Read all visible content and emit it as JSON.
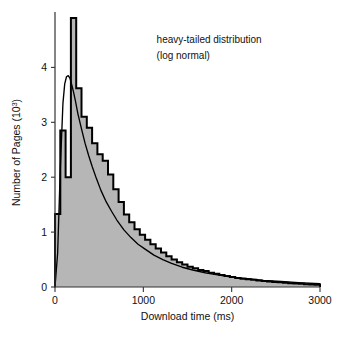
{
  "chart_data": {
    "type": "bar",
    "title": "",
    "xlabel": "Download time (ms)",
    "ylabel": "Number of Pages (10",
    "ylabel_exponent": "3",
    "ylabel_suffix": ")",
    "xlim": [
      0,
      3000
    ],
    "ylim": [
      0,
      4.9
    ],
    "xticks": [
      0,
      1000,
      2000,
      3000
    ],
    "xtick_labels": [
      "0",
      "1000",
      "2000",
      "3000"
    ],
    "yticks": [
      0,
      1,
      2,
      3,
      4
    ],
    "ytick_labels": [
      "0",
      "1",
      "2",
      "3",
      "4"
    ],
    "grid": false,
    "legend": null,
    "annotations": [
      {
        "text": "heavy-tailed distribution",
        "x": 1150,
        "y": 4.45
      },
      {
        "text": "(log normal)",
        "x": 1150,
        "y": 4.15
      }
    ],
    "bin_width": 60,
    "series": [
      {
        "name": "Download time histogram",
        "kind": "histogram",
        "fill_color": "#b6b6b6",
        "line_color": "#000000",
        "bin_left_edges": [
          0,
          60,
          120,
          180,
          240,
          300,
          360,
          420,
          480,
          540,
          600,
          660,
          720,
          780,
          840,
          900,
          960,
          1020,
          1080,
          1140,
          1200,
          1260,
          1320,
          1380,
          1440,
          1500,
          1560,
          1620,
          1680,
          1740,
          1800,
          1860,
          1920,
          1980,
          2040,
          2100,
          2160,
          2220,
          2280,
          2340,
          2400,
          2460,
          2520,
          2580,
          2640,
          2700,
          2760,
          2820,
          2880,
          2940
        ],
        "values": [
          1.33,
          2.85,
          2.0,
          4.95,
          3.62,
          3.1,
          2.9,
          2.62,
          2.42,
          2.3,
          2.05,
          1.78,
          1.55,
          1.32,
          1.18,
          1.05,
          0.95,
          0.86,
          0.78,
          0.7,
          0.63,
          0.56,
          0.5,
          0.45,
          0.41,
          0.37,
          0.34,
          0.31,
          0.29,
          0.26,
          0.24,
          0.22,
          0.2,
          0.18,
          0.165,
          0.15,
          0.14,
          0.13,
          0.12,
          0.11,
          0.1,
          0.092,
          0.085,
          0.078,
          0.07,
          0.064,
          0.058,
          0.052,
          0.047,
          0.042
        ],
        "note_clipped_bar_index": 3
      },
      {
        "name": "log normal fit",
        "kind": "line",
        "line_color": "#000000",
        "x": [
          0,
          30,
          60,
          90,
          110,
          130,
          150,
          170,
          190,
          210,
          230,
          260,
          300,
          340,
          380,
          420,
          470,
          520,
          580,
          640,
          700,
          780,
          860,
          940,
          1020,
          1120,
          1220,
          1320,
          1440,
          1560,
          1700,
          1840,
          2000,
          2180,
          2360,
          2560,
          2760,
          3000
        ],
        "y": [
          0.0,
          0.62,
          2.15,
          3.35,
          3.7,
          3.83,
          3.85,
          3.8,
          3.68,
          3.55,
          3.4,
          3.15,
          2.88,
          2.62,
          2.4,
          2.2,
          1.97,
          1.76,
          1.55,
          1.38,
          1.22,
          1.04,
          0.9,
          0.78,
          0.69,
          0.58,
          0.5,
          0.43,
          0.36,
          0.31,
          0.26,
          0.22,
          0.18,
          0.15,
          0.12,
          0.1,
          0.08,
          0.06
        ]
      }
    ]
  },
  "figure": {
    "background_color": "#ffffff",
    "axis_color": "#333333",
    "text_color": "#111111"
  }
}
